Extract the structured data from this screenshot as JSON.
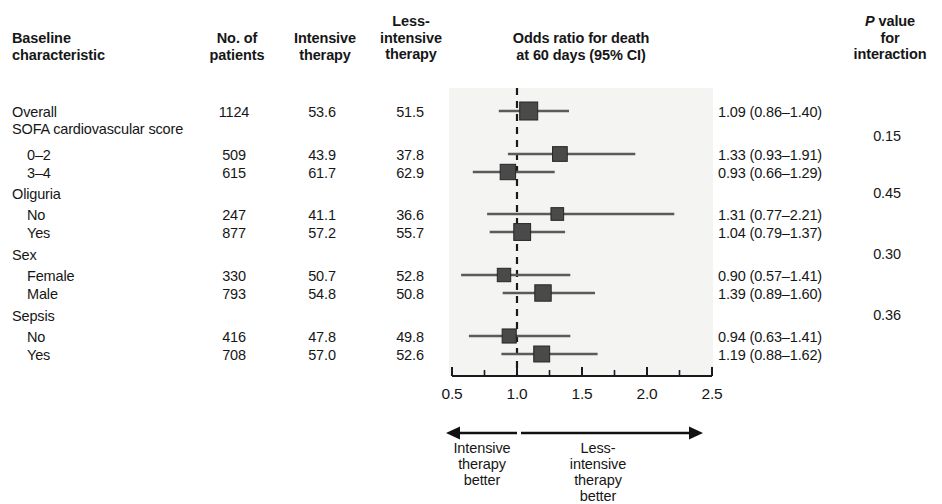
{
  "figure": {
    "type": "forest-plot",
    "headers": {
      "characteristic": "Baseline\ncharacteristic",
      "no_of_patients": "No. of\npatients",
      "intensive_therapy": "Intensive\ntherapy",
      "less_intensive_therapy": "Less-\nintensive\ntherapy",
      "odds_ratio": "Odds ratio for death\nat 60 days (95% CI)",
      "p_value_italic": "P",
      "p_value_rest": " value\nfor\ninteraction"
    },
    "annotation": {
      "left": "Intensive\ntherapy\nbetter",
      "right": "Less-\nintensive\ntherapy\nbetter"
    }
  },
  "rows": [
    {
      "label": "Overall",
      "indent": false,
      "n": "1124",
      "intensive": "53.6",
      "less": "51.5",
      "or_text": "1.09 (0.86–1.40)",
      "or": 1.09,
      "lo": 0.86,
      "hi": 1.4,
      "weight": 1124,
      "y": 105
    },
    {
      "label": "SOFA cardiovascular score",
      "indent": false,
      "n": "",
      "intensive": "",
      "less": "",
      "or_text": "",
      "or": null,
      "lo": null,
      "hi": null,
      "weight": 0,
      "y": 122
    },
    {
      "label": "0–2",
      "indent": true,
      "n": "509",
      "intensive": "43.9",
      "less": "37.8",
      "or_text": "1.33 (0.93–1.91)",
      "or": 1.33,
      "lo": 0.93,
      "hi": 1.91,
      "weight": 509,
      "y": 148
    },
    {
      "label": "3–4",
      "indent": true,
      "n": "615",
      "intensive": "61.7",
      "less": "62.9",
      "or_text": "0.93 (0.66–1.29)",
      "or": 0.93,
      "lo": 0.66,
      "hi": 1.29,
      "weight": 615,
      "y": 166
    },
    {
      "label": "Oliguria",
      "indent": false,
      "n": "",
      "intensive": "",
      "less": "",
      "or_text": "",
      "or": null,
      "lo": null,
      "hi": null,
      "weight": 0,
      "y": 187
    },
    {
      "label": "No",
      "indent": true,
      "n": "247",
      "intensive": "41.1",
      "less": "36.6",
      "or_text": "1.31 (0.77–2.21)",
      "or": 1.31,
      "lo": 0.77,
      "hi": 2.21,
      "weight": 247,
      "y": 208
    },
    {
      "label": "Yes",
      "indent": true,
      "n": "877",
      "intensive": "57.2",
      "less": "55.7",
      "or_text": "1.04 (0.79–1.37)",
      "or": 1.04,
      "lo": 0.79,
      "hi": 1.37,
      "weight": 877,
      "y": 226
    },
    {
      "label": "Sex",
      "indent": false,
      "n": "",
      "intensive": "",
      "less": "",
      "or_text": "",
      "or": null,
      "lo": null,
      "hi": null,
      "weight": 0,
      "y": 248
    },
    {
      "label": "Female",
      "indent": true,
      "n": "330",
      "intensive": "50.7",
      "less": "52.8",
      "or_text": "0.90 (0.57–1.41)",
      "or": 0.9,
      "lo": 0.57,
      "hi": 1.41,
      "weight": 330,
      "y": 269
    },
    {
      "label": "Male",
      "indent": true,
      "n": "793",
      "intensive": "54.8",
      "less": "50.8",
      "or_text": "1.39 (0.89–1.60)",
      "or": 1.2,
      "lo": 0.89,
      "hi": 1.6,
      "weight": 793,
      "y": 287
    },
    {
      "label": "Sepsis",
      "indent": false,
      "n": "",
      "intensive": "",
      "less": "",
      "or_text": "",
      "or": null,
      "lo": null,
      "hi": null,
      "weight": 0,
      "y": 309
    },
    {
      "label": "No",
      "indent": true,
      "n": "416",
      "intensive": "47.8",
      "less": "49.8",
      "or_text": "0.94 (0.63–1.41)",
      "or": 0.94,
      "lo": 0.63,
      "hi": 1.41,
      "weight": 416,
      "y": 330
    },
    {
      "label": "Yes",
      "indent": true,
      "n": "708",
      "intensive": "57.0",
      "less": "52.6",
      "or_text": "1.19 (0.88–1.62)",
      "or": 1.19,
      "lo": 0.88,
      "hi": 1.62,
      "weight": 708,
      "y": 348
    }
  ],
  "p_values": [
    {
      "value": "0.15",
      "y": 129
    },
    {
      "value": "0.45",
      "y": 186
    },
    {
      "value": "0.30",
      "y": 247
    },
    {
      "value": "0.36",
      "y": 308
    }
  ],
  "chart_data": {
    "type": "forest",
    "title": "Odds ratio for death at 60 days (95% CI)",
    "xlabel": "",
    "ylabel": "",
    "xlim": [
      0.5,
      2.5
    ],
    "xscale": "linear",
    "reference_line": 1.0,
    "grid": false,
    "major_ticks": [
      0.5,
      1.0,
      1.5,
      2.0,
      2.5
    ],
    "minor_ticks": [
      0.75,
      1.25,
      1.75,
      2.25
    ],
    "tick_labels": [
      "0.5",
      "1.0",
      "1.5",
      "2.0",
      "2.5"
    ],
    "categories": [
      "Overall",
      "0–2",
      "3–4",
      "No (Oliguria)",
      "Yes (Oliguria)",
      "Female",
      "Male",
      "No (Sepsis)",
      "Yes (Sepsis)"
    ],
    "estimates": [
      1.09,
      1.33,
      0.93,
      1.31,
      1.04,
      0.9,
      1.2,
      0.94,
      1.19
    ],
    "ci_low": [
      0.86,
      0.93,
      0.66,
      0.77,
      0.79,
      0.57,
      0.89,
      0.63,
      0.88
    ],
    "ci_high": [
      1.4,
      1.91,
      1.29,
      2.21,
      1.37,
      1.41,
      1.6,
      1.41,
      1.62
    ],
    "n_patients": [
      1124,
      509,
      615,
      247,
      877,
      330,
      793,
      416,
      708
    ],
    "p_interaction": [
      0.15,
      0.45,
      0.3,
      0.36
    ],
    "marker_color": "#4a4a4a",
    "line_color": "#5a5a5a",
    "plot_background": "#f4f4f2"
  },
  "axis": {
    "tick_labels": [
      {
        "text": "0.5",
        "x": 452
      },
      {
        "text": "1.0",
        "x": 517
      },
      {
        "text": "1.5",
        "x": 582
      },
      {
        "text": "2.0",
        "x": 647
      },
      {
        "text": "2.5",
        "x": 712
      }
    ]
  }
}
